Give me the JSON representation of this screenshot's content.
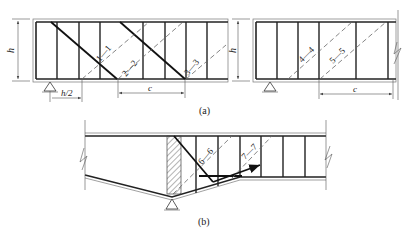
{
  "figure": {
    "part_a": {
      "caption": "(a)",
      "left_beam": {
        "height_label": "h",
        "offset_label": "h/2",
        "spacing_label": "c",
        "sections": [
          "1—1",
          "2—2",
          "3—3"
        ]
      },
      "right_beam": {
        "height_label": "h",
        "spacing_label": "c",
        "sections": [
          "4—4",
          "5—5"
        ]
      }
    },
    "part_b": {
      "caption": "(b)",
      "sections": [
        "6—6",
        "7—7"
      ]
    }
  },
  "colors": {
    "line": "#222222",
    "dashed": "#666666",
    "background": "#ffffff"
  }
}
